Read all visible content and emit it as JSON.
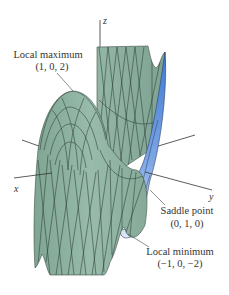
{
  "figure": {
    "type": "3d-surface-plot",
    "axes": {
      "x_label": "x",
      "y_label": "y",
      "z_label": "z"
    },
    "annotations": [
      {
        "id": "local-maximum",
        "label": "Local maximum",
        "coords": "(1, 0, 2)"
      },
      {
        "id": "saddle-point",
        "label": "Saddle point",
        "coords": "(0, 1, 0)"
      },
      {
        "id": "local-minimum",
        "label": "Local minimum",
        "coords": "(−1, 0, −2)"
      }
    ],
    "colors": {
      "surface_green": "#8fb3a2",
      "surface_green_dark": "#6f9686",
      "surface_blue": "#4f86d6",
      "surface_blue_light": "#c9dcf5",
      "mesh_line": "#2c3d35",
      "axis_line": "#333333",
      "label_text": "#333333",
      "background": "#ffffff"
    }
  }
}
